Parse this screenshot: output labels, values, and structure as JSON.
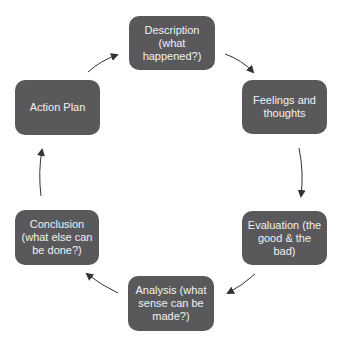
{
  "diagram": {
    "type": "cycle",
    "title": "",
    "colors": {
      "node_fill": "#59585b",
      "node_text": "#f2f2f2",
      "arrow": "#333333",
      "background": "#ffffff"
    },
    "nodes": [
      {
        "id": "description",
        "label": "Description\n(what\nhappened?)"
      },
      {
        "id": "feelings",
        "label": "Feelings and\nthoughts"
      },
      {
        "id": "evaluation",
        "label": "Evaluation (the\ngood & the\nbad)"
      },
      {
        "id": "analysis",
        "label": "Analysis (what\nsense can be\nmade?)"
      },
      {
        "id": "conclusion",
        "label": "Conclusion\n(what else can\nbe done?)"
      },
      {
        "id": "action-plan",
        "label": "Action Plan"
      }
    ],
    "edges": [
      {
        "from": "description",
        "to": "feelings"
      },
      {
        "from": "feelings",
        "to": "evaluation"
      },
      {
        "from": "evaluation",
        "to": "analysis"
      },
      {
        "from": "analysis",
        "to": "conclusion"
      },
      {
        "from": "conclusion",
        "to": "action-plan"
      },
      {
        "from": "action-plan",
        "to": "description"
      }
    ]
  }
}
